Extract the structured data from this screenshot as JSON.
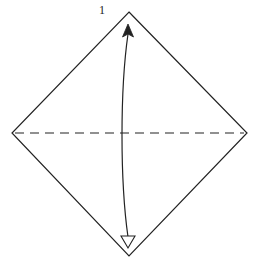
{
  "diagram": {
    "type": "origami-instruction",
    "step_number": "1",
    "colors": {
      "line": "#222222",
      "background": "#ffffff"
    },
    "paper": {
      "shape": "diamond",
      "vertices": {
        "top": [
          129,
          12
        ],
        "right": [
          247,
          133
        ],
        "bottom": [
          129,
          256
        ],
        "left": [
          12,
          133
        ]
      }
    },
    "fold_line": {
      "style": "dashed",
      "kind": "valley-fold",
      "from": [
        14,
        133
      ],
      "to": [
        245,
        133
      ]
    },
    "arrow": {
      "kind": "fold-and-unfold",
      "path": "curved-vertical",
      "top_head": "filled",
      "bottom_head": "hollow"
    }
  }
}
